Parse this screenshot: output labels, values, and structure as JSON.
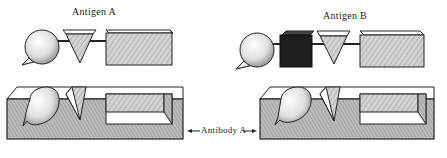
{
  "labels": {
    "antigen_a": "Antigen A",
    "antigen_b": "Antigen B",
    "antibody_a": "Antibody A"
  },
  "colors": {
    "ink": "#222222",
    "hatch_fill": "#c8c8c8",
    "dark_cube": "#1e1e1e",
    "paper": "#ffffff"
  }
}
